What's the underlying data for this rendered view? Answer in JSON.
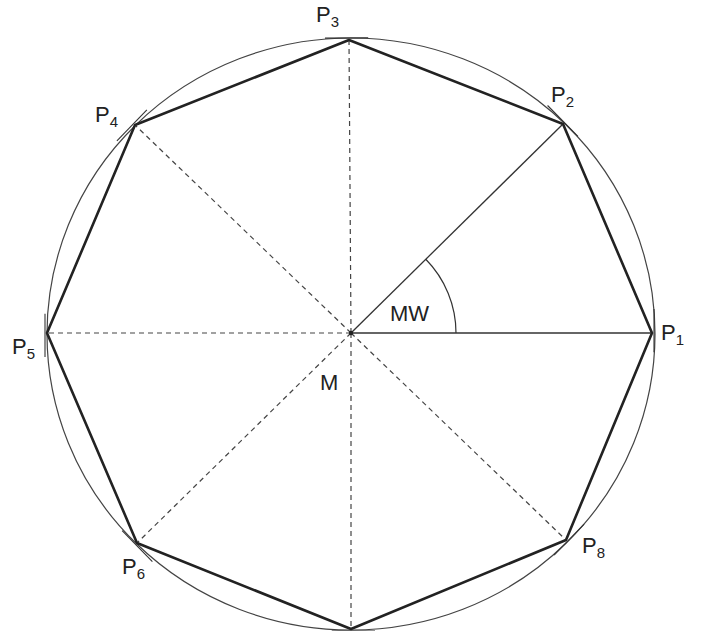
{
  "diagram": {
    "center": {
      "label": "M",
      "x": 351,
      "y": 333
    },
    "angle_label": "MW",
    "circle": {
      "cx": 351,
      "cy": 334,
      "rx": 304,
      "ry": 296
    },
    "points": [
      {
        "id": "P1",
        "base": "P",
        "sub": "1",
        "x": 652,
        "y": 333,
        "lx": 661,
        "ly": 322
      },
      {
        "id": "P2",
        "base": "P",
        "sub": "2",
        "x": 563,
        "y": 124,
        "lx": 551,
        "ly": 84
      },
      {
        "id": "P3",
        "base": "P",
        "sub": "3",
        "x": 349,
        "y": 40,
        "lx": 316,
        "ly": 4
      },
      {
        "id": "P4",
        "base": "P",
        "sub": "4",
        "x": 135,
        "y": 125,
        "lx": 95,
        "ly": 104
      },
      {
        "id": "P5",
        "base": "P",
        "sub": "5",
        "x": 47,
        "y": 333,
        "lx": 12,
        "ly": 336
      },
      {
        "id": "P6",
        "base": "P",
        "sub": "6",
        "x": 137,
        "y": 543,
        "lx": 122,
        "ly": 556
      },
      {
        "id": "P7",
        "base": "",
        "sub": "",
        "x": 351,
        "y": 629,
        "lx": 0,
        "ly": 0
      },
      {
        "id": "P8",
        "base": "P",
        "sub": "8",
        "x": 566,
        "y": 540,
        "lx": 582,
        "ly": 535
      }
    ],
    "colors": {
      "polygon": "#222222",
      "circle": "#444444",
      "radius": "#333333",
      "dashed": "#444444",
      "label": "#222222"
    }
  }
}
